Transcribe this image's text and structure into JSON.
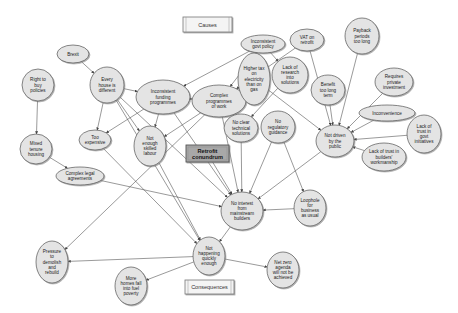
{
  "diagram": {
    "title_boxes": {
      "causes": "Causes",
      "consequences": "Consequences"
    },
    "core": {
      "id": "core",
      "label": [
        "Retrofit",
        "conundrum"
      ]
    },
    "colors": {
      "node_fill": "#e4e4e4",
      "node_stroke": "#555555",
      "core_fill": "#a8a8a8",
      "edge": "#555555",
      "background": "#ffffff"
    },
    "nodes": [
      {
        "id": "govt_policy",
        "label": [
          "Inconsistent",
          "govt policy"
        ],
        "cx": 263,
        "cy": 44,
        "rx": 22,
        "ry": 9
      },
      {
        "id": "vat",
        "label": [
          "VAT on",
          "retrofit"
        ],
        "cx": 307,
        "cy": 40,
        "rx": 17,
        "ry": 11
      },
      {
        "id": "payback",
        "label": [
          "Payback",
          "periods",
          "too long"
        ],
        "cx": 362,
        "cy": 36,
        "rx": 17,
        "ry": 18
      },
      {
        "id": "brexit",
        "label": [
          "Brexit"
        ],
        "cx": 73,
        "cy": 54,
        "rx": 16,
        "ry": 9
      },
      {
        "id": "right_to_buy",
        "label": [
          "Right to",
          "buy",
          "policies"
        ],
        "cx": 38,
        "cy": 85,
        "rx": 16,
        "ry": 16
      },
      {
        "id": "every_house",
        "label": [
          "Every",
          "house is",
          "different"
        ],
        "cx": 107,
        "cy": 85,
        "rx": 17,
        "ry": 18
      },
      {
        "id": "funding",
        "label": [
          "Inconsistent",
          "funding",
          "programmes"
        ],
        "cx": 163,
        "cy": 97,
        "rx": 27,
        "ry": 17
      },
      {
        "id": "complex_prog",
        "label": [
          "Complex",
          "programmes",
          "of work"
        ],
        "cx": 219,
        "cy": 101,
        "rx": 27,
        "ry": 16
      },
      {
        "id": "higher_tax",
        "label": [
          "Higher tax",
          "on",
          "electricity",
          "than on",
          "gas"
        ],
        "cx": 254,
        "cy": 79,
        "rx": 16,
        "ry": 26
      },
      {
        "id": "research",
        "label": [
          "Lack of",
          "research",
          "into",
          "solutions"
        ],
        "cx": 290,
        "cy": 75,
        "rx": 18,
        "ry": 18
      },
      {
        "id": "benefit",
        "label": [
          "Benefit",
          "too long",
          "term"
        ],
        "cx": 328,
        "cy": 90,
        "rx": 17,
        "ry": 15
      },
      {
        "id": "private_inv",
        "label": [
          "Requires",
          "private",
          "investment"
        ],
        "cx": 394,
        "cy": 82,
        "rx": 19,
        "ry": 14
      },
      {
        "id": "inconvenience",
        "label": [
          "Inconvenience"
        ],
        "cx": 387,
        "cy": 113,
        "rx": 28,
        "ry": 8
      },
      {
        "id": "trust_govt",
        "label": [
          "Lack of",
          "trust in",
          "govt",
          "initiatives"
        ],
        "cx": 424,
        "cy": 134,
        "rx": 17,
        "ry": 19
      },
      {
        "id": "trust_builders",
        "label": [
          "Lack of trust in",
          "builders'",
          "workmanship"
        ],
        "cx": 384,
        "cy": 157,
        "rx": 22,
        "ry": 14
      },
      {
        "id": "not_driven",
        "label": [
          "Not driven",
          "by the",
          "public"
        ],
        "cx": 335,
        "cy": 141,
        "rx": 19,
        "ry": 16
      },
      {
        "id": "no_clear_tech",
        "label": [
          "No clear",
          "technical",
          "solutions"
        ],
        "cx": 241,
        "cy": 128,
        "rx": 17,
        "ry": 14
      },
      {
        "id": "no_reg",
        "label": [
          "No",
          "regulatory",
          "guidance"
        ],
        "cx": 278,
        "cy": 127,
        "rx": 17,
        "ry": 16
      },
      {
        "id": "too_expensive",
        "label": [
          "Too",
          "expensive"
        ],
        "cx": 95,
        "cy": 140,
        "rx": 16,
        "ry": 10
      },
      {
        "id": "skilled_labour",
        "label": [
          "Not",
          "enough",
          "skilled",
          "labour"
        ],
        "cx": 150,
        "cy": 146,
        "rx": 16,
        "ry": 20
      },
      {
        "id": "mixed_tenure",
        "label": [
          "Mixed",
          "tenure",
          "housing"
        ],
        "cx": 36,
        "cy": 149,
        "rx": 16,
        "ry": 15
      },
      {
        "id": "legal",
        "label": [
          "Complex legal",
          "agreements"
        ],
        "cx": 80,
        "cy": 176,
        "rx": 24,
        "ry": 9
      },
      {
        "id": "no_interest",
        "label": [
          "No interest",
          "from",
          "mainstream",
          "builders"
        ],
        "cx": 242,
        "cy": 211,
        "rx": 21,
        "ry": 19
      },
      {
        "id": "loophole",
        "label": [
          "Loophole",
          "for",
          "business",
          "as usual"
        ],
        "cx": 310,
        "cy": 208,
        "rx": 16,
        "ry": 18
      },
      {
        "id": "not_happening",
        "label": [
          "Not",
          "happening",
          "quickly",
          "enough"
        ],
        "cx": 209,
        "cy": 256,
        "rx": 16,
        "ry": 19
      },
      {
        "id": "demolish",
        "label": [
          "Pressure",
          "to",
          "demolish",
          "and",
          "rebuild"
        ],
        "cx": 52,
        "cy": 262,
        "rx": 16,
        "ry": 21
      },
      {
        "id": "fuel_poverty",
        "label": [
          "More",
          "homes fall",
          "into fuel",
          "poverty"
        ],
        "cx": 131,
        "cy": 286,
        "rx": 16,
        "ry": 19
      },
      {
        "id": "net_zero",
        "label": [
          "Net zero",
          "agenda",
          "will not be",
          "achieved"
        ],
        "cx": 283,
        "cy": 270,
        "rx": 16,
        "ry": 18
      }
    ],
    "edges": [
      [
        "brexit",
        "every_house"
      ],
      [
        "right_to_buy",
        "mixed_tenure"
      ],
      [
        "mixed_tenure",
        "legal"
      ],
      [
        "legal",
        "no_interest"
      ],
      [
        "every_house",
        "too_expensive"
      ],
      [
        "every_house",
        "skilled_labour"
      ],
      [
        "every_house",
        "funding"
      ],
      [
        "every_house",
        "no_interest"
      ],
      [
        "every_house",
        "not_happening"
      ],
      [
        "funding",
        "too_expensive"
      ],
      [
        "funding",
        "skilled_labour"
      ],
      [
        "funding",
        "complex_prog"
      ],
      [
        "funding",
        "no_interest"
      ],
      [
        "complex_prog",
        "skilled_labour"
      ],
      [
        "complex_prog",
        "no_interest"
      ],
      [
        "complex_prog",
        "demolish"
      ],
      [
        "govt_policy",
        "funding"
      ],
      [
        "govt_policy",
        "research"
      ],
      [
        "govt_policy",
        "complex_prog"
      ],
      [
        "vat",
        "complex_prog"
      ],
      [
        "vat",
        "not_driven"
      ],
      [
        "higher_tax",
        "not_driven"
      ],
      [
        "research",
        "no_clear_tech"
      ],
      [
        "payback",
        "not_driven"
      ],
      [
        "benefit",
        "not_driven"
      ],
      [
        "private_inv",
        "not_driven"
      ],
      [
        "inconvenience",
        "not_driven"
      ],
      [
        "trust_govt",
        "not_driven"
      ],
      [
        "trust_builders",
        "not_driven"
      ],
      [
        "not_driven",
        "no_interest"
      ],
      [
        "no_clear_tech",
        "no_interest"
      ],
      [
        "no_reg",
        "no_interest"
      ],
      [
        "no_reg",
        "loophole"
      ],
      [
        "loophole",
        "no_interest"
      ],
      [
        "core",
        "no_interest"
      ],
      [
        "too_expensive",
        "not_happening"
      ],
      [
        "skilled_labour",
        "not_happening"
      ],
      [
        "no_interest",
        "not_happening"
      ],
      [
        "not_happening",
        "demolish"
      ],
      [
        "not_happening",
        "fuel_poverty"
      ],
      [
        "not_happening",
        "net_zero"
      ]
    ]
  }
}
